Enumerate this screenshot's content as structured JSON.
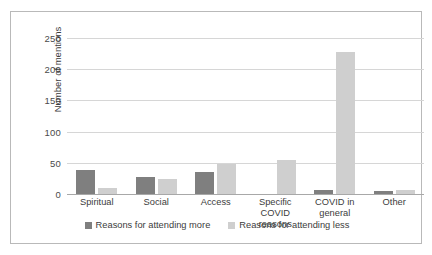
{
  "chart_data": {
    "type": "bar",
    "title": "",
    "xlabel": "",
    "ylabel": "Number of mentions",
    "ylim": [
      0,
      250
    ],
    "yticks": [
      0,
      50,
      100,
      150,
      200,
      250
    ],
    "grid": true,
    "legend_position": "bottom",
    "categories": [
      "Spiritual",
      "Social",
      "Access",
      "Specific COVID reasons",
      "COVID in general",
      "Other"
    ],
    "series": [
      {
        "name": "Reasons for attending more",
        "color": "#7f7f7f",
        "values": [
          39,
          28,
          36,
          0,
          7,
          5
        ]
      },
      {
        "name": "Reasons for attending less",
        "color": "#cfcfcf",
        "values": [
          10,
          24,
          48,
          55,
          228,
          7
        ]
      }
    ]
  },
  "axis": {
    "y_title": "Number of mentions"
  },
  "colors": {
    "series_more": "#7f7f7f",
    "series_less": "#cfcfcf",
    "gridline": "#d6d6d6",
    "frame": "#b9b9b9"
  }
}
